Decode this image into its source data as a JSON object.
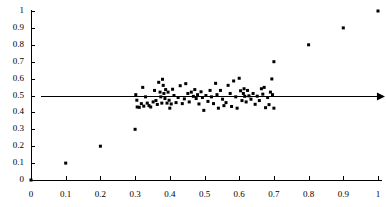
{
  "chart_data": {
    "type": "scatter",
    "title": "",
    "subtitle": "",
    "xlabel": "",
    "ylabel": "",
    "xlim": [
      0,
      1
    ],
    "ylim": [
      0,
      1
    ],
    "grid": false,
    "legend": null,
    "x_ticks": [
      0,
      0.1,
      0.2,
      0.3,
      0.4,
      0.5,
      0.6,
      0.7,
      0.8,
      0.9,
      1
    ],
    "y_ticks": [
      0,
      0.1,
      0.2,
      0.3,
      0.4,
      0.5,
      0.6,
      0.7,
      0.8,
      0.9,
      1
    ],
    "x_tick_labels": [
      "0",
      "0.1",
      "0.2",
      "0.3",
      "0.4",
      "0.5",
      "0.6",
      "0.7",
      "0.8",
      "0.9",
      "1"
    ],
    "y_tick_labels": [
      "0",
      "0.1",
      "0.2",
      "0.3",
      "0.4",
      "0.5",
      "0.6",
      "0.7",
      "0.8",
      "0.9",
      "1"
    ],
    "marker": {
      "shape": "square",
      "size_px": 3,
      "color": "#000000"
    },
    "annotations": [
      {
        "kind": "horizontal-arrow-line",
        "y": 0.5,
        "x_start": 0.03,
        "x_end": 1.02,
        "color": "#000000",
        "arrowhead": "right"
      }
    ],
    "series": [
      {
        "name": "diagonal-points",
        "color": "#000000",
        "points": [
          [
            0.0,
            0.0
          ],
          [
            0.1,
            0.1
          ],
          [
            0.2,
            0.2
          ],
          [
            0.3,
            0.3
          ],
          [
            0.7,
            0.7
          ],
          [
            0.8,
            0.8
          ],
          [
            0.9,
            0.9
          ],
          [
            1.0,
            1.0
          ]
        ]
      },
      {
        "name": "central-cluster",
        "color": "#000000",
        "points": [
          [
            0.302,
            0.505
          ],
          [
            0.305,
            0.472
          ],
          [
            0.306,
            0.432
          ],
          [
            0.312,
            0.43
          ],
          [
            0.318,
            0.452
          ],
          [
            0.322,
            0.548
          ],
          [
            0.325,
            0.437
          ],
          [
            0.33,
            0.492
          ],
          [
            0.335,
            0.455
          ],
          [
            0.34,
            0.44
          ],
          [
            0.345,
            0.432
          ],
          [
            0.352,
            0.462
          ],
          [
            0.356,
            0.53
          ],
          [
            0.36,
            0.47
          ],
          [
            0.364,
            0.447
          ],
          [
            0.368,
            0.578
          ],
          [
            0.372,
            0.52
          ],
          [
            0.374,
            0.492
          ],
          [
            0.377,
            0.455
          ],
          [
            0.379,
            0.596
          ],
          [
            0.381,
            0.56
          ],
          [
            0.383,
            0.512
          ],
          [
            0.386,
            0.482
          ],
          [
            0.388,
            0.535
          ],
          [
            0.392,
            0.455
          ],
          [
            0.395,
            0.52
          ],
          [
            0.398,
            0.472
          ],
          [
            0.4,
            0.425
          ],
          [
            0.404,
            0.45
          ],
          [
            0.408,
            0.537
          ],
          [
            0.412,
            0.5
          ],
          [
            0.418,
            0.458
          ],
          [
            0.424,
            0.488
          ],
          [
            0.43,
            0.558
          ],
          [
            0.436,
            0.452
          ],
          [
            0.442,
            0.48
          ],
          [
            0.446,
            0.57
          ],
          [
            0.452,
            0.512
          ],
          [
            0.456,
            0.462
          ],
          [
            0.462,
            0.52
          ],
          [
            0.468,
            0.495
          ],
          [
            0.472,
            0.535
          ],
          [
            0.476,
            0.482
          ],
          [
            0.48,
            0.505
          ],
          [
            0.484,
            0.45
          ],
          [
            0.49,
            0.522
          ],
          [
            0.494,
            0.488
          ],
          [
            0.498,
            0.412
          ],
          [
            0.504,
            0.5
          ],
          [
            0.51,
            0.465
          ],
          [
            0.516,
            0.53
          ],
          [
            0.52,
            0.492
          ],
          [
            0.526,
            0.452
          ],
          [
            0.532,
            0.572
          ],
          [
            0.536,
            0.505
          ],
          [
            0.54,
            0.425
          ],
          [
            0.546,
            0.53
          ],
          [
            0.552,
            0.478
          ],
          [
            0.556,
            0.44
          ],
          [
            0.562,
            0.458
          ],
          [
            0.568,
            0.56
          ],
          [
            0.574,
            0.512
          ],
          [
            0.578,
            0.435
          ],
          [
            0.584,
            0.586
          ],
          [
            0.59,
            0.492
          ],
          [
            0.594,
            0.425
          ],
          [
            0.6,
            0.602
          ],
          [
            0.604,
            0.528
          ],
          [
            0.608,
            0.47
          ],
          [
            0.612,
            0.512
          ],
          [
            0.614,
            0.54
          ],
          [
            0.616,
            0.495
          ],
          [
            0.62,
            0.462
          ],
          [
            0.624,
            0.53
          ],
          [
            0.628,
            0.498
          ],
          [
            0.634,
            0.478
          ],
          [
            0.64,
            0.512
          ],
          [
            0.646,
            0.448
          ],
          [
            0.652,
            0.496
          ],
          [
            0.658,
            0.47
          ],
          [
            0.664,
            0.54
          ],
          [
            0.668,
            0.508
          ],
          [
            0.672,
            0.548
          ],
          [
            0.676,
            0.428
          ],
          [
            0.682,
            0.488
          ],
          [
            0.686,
            0.446
          ],
          [
            0.69,
            0.52
          ],
          [
            0.694,
            0.598
          ],
          [
            0.696,
            0.505
          ],
          [
            0.7,
            0.425
          ]
        ]
      }
    ]
  },
  "axes_geometry": {
    "origin_px": {
      "x": 31,
      "y": 180
    },
    "x_end_px": 378,
    "y_top_px": 11,
    "tick_len_px": 4,
    "axis_color": "#000000"
  }
}
